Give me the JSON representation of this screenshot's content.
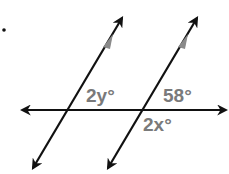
{
  "diagram": {
    "bullet": "•",
    "labels": {
      "angle_2y": "2y°",
      "angle_58": "58°",
      "angle_2x": "2x°"
    },
    "colors": {
      "line": "#111111",
      "label": "#7a7a7a",
      "parallel_marker": "#8a8a8a"
    }
  }
}
